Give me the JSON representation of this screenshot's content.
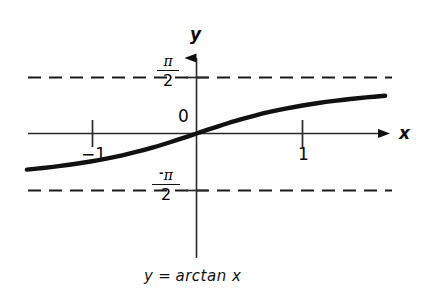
{
  "figure": {
    "caption_lhs": "y",
    "caption_eq": "=",
    "caption_rhs": "arctan x",
    "caption_full": "y = arctan x",
    "background_color": "#ffffff",
    "ink_color": "#111111"
  },
  "axes": {
    "x_axis_label": "x",
    "y_axis_label": "y",
    "origin_label": "0",
    "x_ticks": [
      {
        "label": "−1",
        "value": -1
      },
      {
        "label": "1",
        "value": 1
      }
    ],
    "y_reference_lines": [
      {
        "label_numerator": "π",
        "label_denominator": "2",
        "label_sign": "",
        "label_text": "π/2",
        "value": 1.5708,
        "style": "dashed"
      },
      {
        "label_numerator": "π",
        "label_denominator": "2",
        "label_sign": "-",
        "label_text": "-π/2",
        "value": -1.5708,
        "style": "dashed"
      }
    ]
  },
  "chart_data": {
    "type": "line",
    "xlabel": "x",
    "ylabel": "y",
    "xlim": [
      -1.6,
      1.84
    ],
    "ylim": [
      -1.78,
      1.78
    ],
    "grid": false,
    "legend": false,
    "xticks": [
      -1,
      1
    ],
    "xticklabels": [
      "−1",
      "1"
    ],
    "yticks": [
      -1.5708,
      1.5708
    ],
    "yticklabels": [
      "-π/2",
      "π/2"
    ],
    "asymptotes": [
      {
        "orientation": "horizontal",
        "y": 1.5708,
        "label": "π/2",
        "dashed": true
      },
      {
        "orientation": "horizontal",
        "y": -1.5708,
        "label": "-π/2",
        "dashed": true
      }
    ],
    "series": [
      {
        "name": "y = arctan x",
        "linewidth": "thick",
        "color": "#111111",
        "x": [
          -1.6,
          -1.45,
          -1.3,
          -1.15,
          -1.0,
          -0.85,
          -0.7,
          -0.55,
          -0.4,
          -0.25,
          -0.1,
          0.0,
          0.1,
          0.25,
          0.4,
          0.55,
          0.7,
          0.85,
          1.0,
          1.15,
          1.3,
          1.45,
          1.6,
          1.78
        ],
        "y": [
          -1.012,
          -0.967,
          -0.915,
          -0.855,
          -0.785,
          -0.704,
          -0.611,
          -0.503,
          -0.381,
          -0.245,
          -0.1,
          0.0,
          0.1,
          0.245,
          0.381,
          0.503,
          0.611,
          0.704,
          0.785,
          0.855,
          0.915,
          0.967,
          1.012,
          1.059
        ]
      }
    ]
  }
}
